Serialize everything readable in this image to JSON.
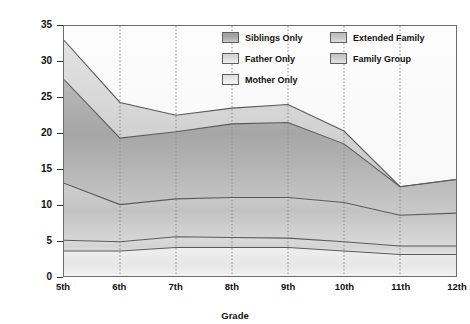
{
  "chart_data": {
    "type": "area",
    "title": "",
    "xlabel": "Grade",
    "ylabel": "Percentage of Waking Hours",
    "categories": [
      "5th",
      "6th",
      "7th",
      "8th",
      "9th",
      "10th",
      "11th",
      "12th"
    ],
    "ylim": [
      0,
      35
    ],
    "yticks": [
      0,
      5,
      10,
      15,
      20,
      25,
      30,
      35
    ],
    "grid": "vertical-dotted",
    "stacked": true,
    "legend_position": "top-right-inside",
    "series": [
      {
        "name": "Mother Only",
        "color": "#e3e3e3",
        "values": [
          3.5,
          3.5,
          4.0,
          4.0,
          4.0,
          3.5,
          3.0,
          3.0
        ]
      },
      {
        "name": "Father Only",
        "color": "#d2d2d2",
        "values": [
          1.5,
          1.3,
          1.5,
          1.4,
          1.3,
          1.3,
          1.2,
          1.2
        ]
      },
      {
        "name": "Family Group",
        "color": "#c3c3c3",
        "values": [
          8.0,
          5.2,
          5.3,
          5.6,
          5.7,
          5.5,
          4.3,
          4.6
        ]
      },
      {
        "name": "Siblings Only",
        "color": "#a9a9a9",
        "values": [
          14.5,
          9.3,
          9.4,
          10.3,
          10.5,
          8.2,
          4.0,
          4.7
        ]
      },
      {
        "name": "Extended Family",
        "color": "#d8d8d8",
        "values": [
          5.5,
          5.0,
          2.3,
          2.2,
          2.5,
          1.8,
          0.0,
          0.0
        ]
      }
    ],
    "cumulative_boundaries": {
      "mother_only": [
        3.5,
        3.5,
        4.0,
        4.0,
        4.0,
        3.5,
        3.0,
        3.0
      ],
      "father_only": [
        5.0,
        4.8,
        5.5,
        5.4,
        5.3,
        4.8,
        4.2,
        4.2
      ],
      "family_group": [
        13.0,
        10.0,
        10.8,
        11.0,
        11.0,
        10.3,
        8.5,
        8.8
      ],
      "siblings_only": [
        27.5,
        19.3,
        20.2,
        21.3,
        21.5,
        18.5,
        12.5,
        13.5
      ],
      "extended_family": [
        33.0,
        24.3,
        22.5,
        23.5,
        24.0,
        20.3,
        12.5,
        13.5
      ]
    }
  },
  "legend": {
    "entries": [
      {
        "label": "Siblings Only",
        "swatch": "siblings-only-swatch"
      },
      {
        "label": "Extended Family",
        "swatch": "extended-family-swatch"
      },
      {
        "label": "Father Only",
        "swatch": "father-only-swatch"
      },
      {
        "label": "Family Group",
        "swatch": "family-group-swatch"
      },
      {
        "label": "Mother Only",
        "swatch": "mother-only-swatch"
      }
    ]
  },
  "axes": {
    "y_title": "Percentage of Waking Hours",
    "x_title": "Grade",
    "y_ticks": [
      "0",
      "5",
      "10",
      "15",
      "20",
      "25",
      "30",
      "35"
    ],
    "x_ticks": [
      "5th",
      "6th",
      "7th",
      "8th",
      "9th",
      "10th",
      "11th",
      "12th"
    ]
  },
  "colors": {
    "frame": "#6d6d6d",
    "line": "#5a5a5a",
    "gridline": "#8a8a8a",
    "text": "#111111",
    "background": "#ffffff"
  }
}
